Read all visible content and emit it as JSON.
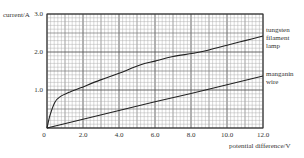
{
  "chart_data": {
    "type": "line",
    "title": "",
    "xlabel": "potential difference/V",
    "ylabel": "current/A",
    "xlim": [
      0,
      12.0
    ],
    "ylim": [
      0,
      3.0
    ],
    "grid": true,
    "x_ticks": [
      "0",
      "2.0",
      "4.0",
      "6.0",
      "8.0",
      "10.0",
      "12.0"
    ],
    "y_ticks": [
      "1.0",
      "2.0",
      "3.0"
    ],
    "legend_position": "right, inline labels at line ends",
    "series": [
      {
        "name": "tungsten filament lamp",
        "label_lines": [
          "tungsten",
          "filament",
          "lamp"
        ],
        "x": [
          0,
          0.17,
          0.44,
          0.72,
          1.28,
          1.83,
          2.94,
          4.0,
          5.17,
          6.0,
          7.0,
          8.5,
          10.0,
          11.0,
          12.0
        ],
        "y": [
          0,
          0.34,
          0.68,
          0.82,
          0.95,
          1.05,
          1.26,
          1.44,
          1.66,
          1.76,
          1.88,
          2.0,
          2.18,
          2.3,
          2.42
        ]
      },
      {
        "name": "manganin wire",
        "label_lines": [
          "manganin",
          "wire"
        ],
        "x": [
          0,
          2.0,
          4.0,
          6.0,
          8.0,
          10.0,
          12.0
        ],
        "y": [
          0,
          0.23,
          0.46,
          0.69,
          0.91,
          1.14,
          1.37
        ]
      }
    ]
  },
  "labels": {
    "y_axis": "current/A",
    "x_axis": "potential difference/V",
    "origin": "0"
  }
}
